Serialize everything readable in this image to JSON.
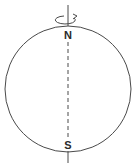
{
  "diagram": {
    "type": "globe-rotation-axis",
    "labels": {
      "north": "N",
      "south": "S"
    },
    "colors": {
      "stroke": "#4a4a4a",
      "label": "#2a2a2a",
      "background": "#ffffff"
    },
    "elements": {
      "sphere": "circle",
      "axis": "dashed line through poles",
      "rotation_indicator": "curved arrow around axis at north pole"
    }
  }
}
